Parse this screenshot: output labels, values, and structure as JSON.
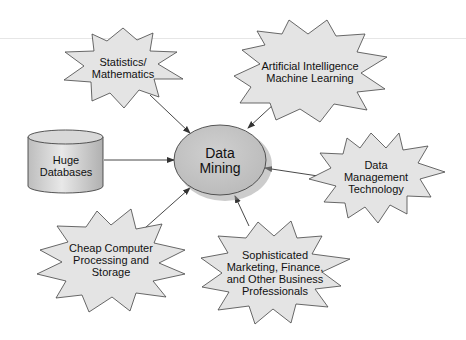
{
  "diagram": {
    "center": {
      "lines": [
        "Data",
        "Mining"
      ],
      "shape": "ellipse",
      "fill": "#c8c8c8"
    },
    "nodes": [
      {
        "id": "statistics",
        "lines": [
          "Statistics/",
          "Mathematics"
        ],
        "shape": "starburst"
      },
      {
        "id": "ai",
        "lines": [
          "Artificial Intelligence",
          "Machine Learning"
        ],
        "shape": "starburst"
      },
      {
        "id": "databases",
        "lines": [
          "Huge",
          "Databases"
        ],
        "shape": "cylinder"
      },
      {
        "id": "data-management",
        "lines": [
          "Data",
          "Management",
          "Technology"
        ],
        "shape": "starburst"
      },
      {
        "id": "cheap-computer",
        "lines": [
          "Cheap Computer",
          "Processing and",
          "Storage"
        ],
        "shape": "starburst"
      },
      {
        "id": "professionals",
        "lines": [
          "Sophisticated",
          "Marketing, Finance,",
          "and Other Business",
          "Professionals"
        ],
        "shape": "starburst"
      }
    ],
    "edges": [
      {
        "from": "statistics",
        "to": "center"
      },
      {
        "from": "ai",
        "to": "center"
      },
      {
        "from": "databases",
        "to": "center"
      },
      {
        "from": "data-management",
        "to": "center"
      },
      {
        "from": "cheap-computer",
        "to": "center"
      },
      {
        "from": "professionals",
        "to": "center"
      }
    ],
    "colors": {
      "star_fill": "#e4e4e4",
      "stroke": "#444444",
      "text": "#111111"
    }
  }
}
